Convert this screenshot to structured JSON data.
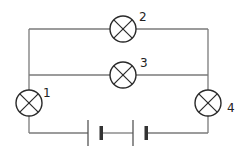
{
  "diagram": {
    "type": "circuit",
    "lamps": [
      {
        "id": "lamp-1",
        "label": "1"
      },
      {
        "id": "lamp-2",
        "label": "2"
      },
      {
        "id": "lamp-3",
        "label": "3"
      },
      {
        "id": "lamp-4",
        "label": "4"
      }
    ],
    "battery": {
      "cells": 2
    },
    "colors": {
      "wire": "#7a7a7a",
      "symbol": "#2a2a2a"
    }
  }
}
